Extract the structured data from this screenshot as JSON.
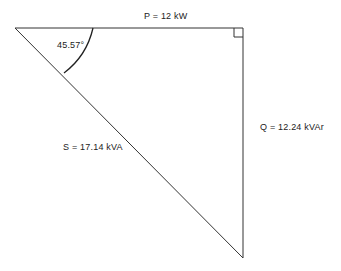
{
  "diagram": {
    "type": "power-triangle",
    "labels": {
      "real_power": "P = 12 kW",
      "reactive_power": "Q = 12.24 kVAr",
      "apparent_power": "S = 17.14 kVA",
      "angle": "45.57°"
    },
    "values": {
      "P_kW": 12,
      "Q_kVAr": 12.24,
      "S_kVA": 17.14,
      "phase_angle_deg": 45.57
    },
    "colors": {
      "line": "#333333",
      "text": "#222222",
      "background": "#ffffff"
    }
  }
}
